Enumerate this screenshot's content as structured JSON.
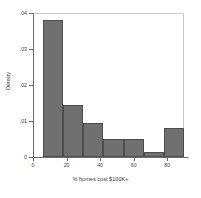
{
  "chart_data": {
    "type": "bar",
    "title": "",
    "subtitle": "",
    "xlabel": "% homes cost $100K+",
    "ylabel": "Density",
    "grid": false,
    "legend": null,
    "xlim": [
      0,
      90
    ],
    "ylim": [
      0,
      0.04
    ],
    "xticks": [
      0,
      20,
      40,
      60,
      80
    ],
    "xtick_labels": [
      "0",
      "20",
      "40",
      "60",
      "80"
    ],
    "yticks": [
      0,
      0.01,
      0.02,
      0.03,
      0.04
    ],
    "ytick_labels": [
      "0",
      ".01",
      ".02",
      ".03",
      ".04"
    ],
    "bin_edges": [
      6,
      18,
      30,
      42,
      54,
      66,
      78,
      90
    ],
    "categories": [
      "6-18",
      "18-30",
      "30-42",
      "42-54",
      "54-66",
      "66-78",
      "78-90"
    ],
    "values": [
      0.038,
      0.0145,
      0.0095,
      0.005,
      0.005,
      0.0015,
      0.008
    ],
    "bar_color": "#707070",
    "bar_edge_color": "#4d4d4d",
    "axis_color": "#6e6e6e",
    "background_color": "#ffffff"
  }
}
